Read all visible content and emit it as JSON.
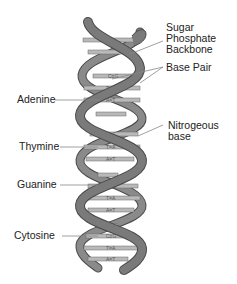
{
  "diagram": {
    "colors": {
      "backbone": "#7a7a7a",
      "backbone_edge": "#4a4a4a",
      "base_pair": "#b9b9b9",
      "base_pair_edge": "#6a6a6a",
      "label_text": "#222222",
      "leader_line": "#888888",
      "background": "#ffffff"
    },
    "labels_right": [
      {
        "id": "sugar-phosphate-backbone",
        "lines": [
          "Sugar",
          "Phosphate",
          "Backbone"
        ]
      },
      {
        "id": "base-pair",
        "lines": [
          "Base Pair"
        ]
      },
      {
        "id": "nitrogeous-base",
        "lines": [
          "Nitrogeous",
          "base"
        ]
      }
    ],
    "labels_left": [
      {
        "id": "adenine",
        "text": "Adenine"
      },
      {
        "id": "thymine",
        "text": "Thymine"
      },
      {
        "id": "guanine",
        "text": "Guanine"
      },
      {
        "id": "cytosine",
        "text": "Cytosine"
      }
    ],
    "base_pairs": [
      "G≡C",
      "C≡G",
      "T=A",
      "A=T",
      "G≡C",
      "T=A",
      "A=T",
      "G≡C",
      "T=A",
      "A=T",
      "C≡G",
      "T=A",
      "A=T"
    ]
  }
}
